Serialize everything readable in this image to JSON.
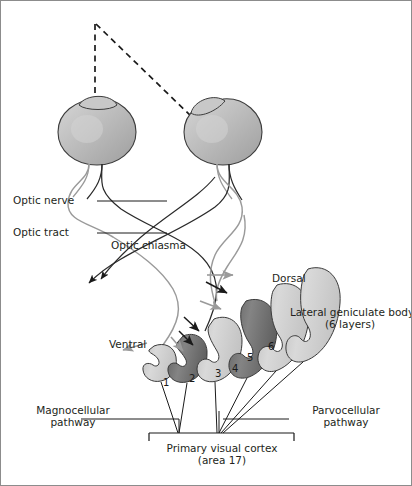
{
  "figure": {
    "border_color": "#8c8c8c",
    "background": "#ffffff"
  },
  "labels": {
    "optic_nerve": "Optic nerve",
    "optic_tract": "Optic tract",
    "optic_chiasma": "Optic chiasma",
    "dorsal": "Dorsal",
    "ventral": "Ventral",
    "lgb_line1": "Lateral geniculate body",
    "lgb_line2": "(6 layers)",
    "magnocellular_line1": "Magnocellular",
    "magnocellular_line2": "pathway",
    "parvocellular_line1": "Parvocellular",
    "parvocellular_line2": "pathway",
    "cortex_line1": "Primary visual cortex",
    "cortex_line2": "(area 17)"
  },
  "lgn_layers": [
    {
      "number": "1",
      "type": "magnocellular",
      "shade": "light"
    },
    {
      "number": "2",
      "type": "magnocellular",
      "shade": "dark"
    },
    {
      "number": "3",
      "type": "parvocellular",
      "shade": "light"
    },
    {
      "number": "4",
      "type": "parvocellular",
      "shade": "dark"
    },
    {
      "number": "5",
      "type": "parvocellular",
      "shade": "light"
    },
    {
      "number": "6",
      "type": "parvocellular",
      "shade": "dark"
    }
  ],
  "eyes": [
    {
      "side": "left",
      "name": "left-eye"
    },
    {
      "side": "right",
      "name": "right-eye"
    }
  ],
  "colors": {
    "ink": "#231f20",
    "stroke_dark": "#1a1a1a",
    "stroke_grey": "#9a9a9a",
    "fill_light": "#cfcfcf",
    "fill_dark": "#6e6e6e",
    "eye_fill": "#b8b8b8"
  }
}
